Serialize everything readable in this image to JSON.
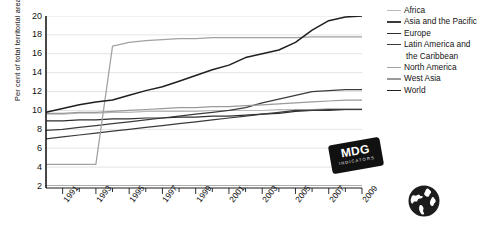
{
  "chart_data": {
    "type": "line",
    "title": "",
    "subtitle": "",
    "xlabel": "",
    "ylabel": "Per cent of total territorial area",
    "xlim": [
      1990,
      2009
    ],
    "ylim": [
      2,
      20
    ],
    "ytick_step": 2,
    "grid": "horizontal",
    "legend_position": "right",
    "x": [
      1990,
      1991,
      1992,
      1993,
      1994,
      1995,
      1996,
      1997,
      1998,
      1999,
      2000,
      2001,
      2002,
      2003,
      2004,
      2005,
      2006,
      2007,
      2008,
      2009
    ],
    "yticks": [
      2,
      4,
      6,
      8,
      10,
      12,
      14,
      16,
      18,
      20
    ],
    "xticks_labeled": [
      "1991",
      "1993",
      "1995",
      "1997",
      "1999",
      "2001",
      "2003",
      "2005",
      "2007",
      "2009"
    ],
    "series": [
      {
        "name": "Africa",
        "color": "#b9b9b9",
        "width": 1.1,
        "values": [
          9.6,
          9.6,
          9.7,
          9.7,
          9.8,
          9.8,
          9.9,
          9.9,
          9.9,
          9.9,
          10.0,
          10.0,
          10.0,
          10.0,
          10.1,
          10.1,
          10.1,
          10.2,
          10.2,
          10.2
        ]
      },
      {
        "name": "Asia and the Pacific",
        "color": "#3b3b3b",
        "width": 1.2,
        "values": [
          7.9,
          8.0,
          8.2,
          8.4,
          8.6,
          8.8,
          9.0,
          9.2,
          9.4,
          9.6,
          9.8,
          10.0,
          10.3,
          10.8,
          11.2,
          11.6,
          12.0,
          12.1,
          12.2,
          12.2
        ]
      },
      {
        "name": "Europe",
        "color": "#2e2e2e",
        "width": 1.2,
        "values": [
          8.9,
          8.9,
          9.0,
          9.0,
          9.1,
          9.1,
          9.2,
          9.2,
          9.3,
          9.3,
          9.4,
          9.4,
          9.5,
          9.6,
          9.7,
          9.9,
          10.0,
          10.0,
          10.1,
          10.1
        ]
      },
      {
        "name": "Latin America and the Caribbean",
        "color": "#3a3a3a",
        "width": 1.2,
        "values": [
          7.0,
          7.2,
          7.4,
          7.6,
          7.8,
          8.0,
          8.2,
          8.4,
          8.6,
          8.8,
          9.0,
          9.2,
          9.4,
          9.6,
          9.8,
          10.0,
          10.0,
          10.1,
          10.1,
          10.1
        ]
      },
      {
        "name": "North America",
        "color": "#a2a2a2",
        "width": 1.3,
        "values": [
          4.3,
          4.3,
          4.3,
          4.3,
          16.8,
          17.2,
          17.4,
          17.5,
          17.6,
          17.6,
          17.7,
          17.7,
          17.7,
          17.7,
          17.7,
          17.7,
          17.8,
          17.8,
          17.8,
          17.8
        ]
      },
      {
        "name": "West Asia",
        "color": "#9a9a9a",
        "width": 1.2,
        "values": [
          9.7,
          9.7,
          9.8,
          9.8,
          9.9,
          10.0,
          10.1,
          10.2,
          10.3,
          10.3,
          10.4,
          10.4,
          10.5,
          10.6,
          10.7,
          10.8,
          10.9,
          11.0,
          11.1,
          11.1
        ]
      },
      {
        "name": "World",
        "color": "#1f1f1f",
        "width": 1.5,
        "values": [
          9.8,
          10.2,
          10.6,
          10.9,
          11.1,
          11.6,
          12.1,
          12.5,
          13.1,
          13.7,
          14.3,
          14.8,
          15.6,
          16.0,
          16.4,
          17.2,
          18.5,
          19.5,
          19.9,
          20.0
        ]
      }
    ]
  },
  "legend": {
    "entries": [
      {
        "label": "Africa"
      },
      {
        "label": "Asia and the Pacific"
      },
      {
        "label": "Europe"
      },
      {
        "label": "Latin America and"
      },
      {
        "label": "the Caribbean"
      },
      {
        "label": "North America"
      },
      {
        "label": "West Asia"
      },
      {
        "label": "World"
      }
    ]
  },
  "badge": {
    "main": "MDG",
    "sub": "INDICATORS"
  },
  "icons": {
    "globe": "globe-icon"
  }
}
